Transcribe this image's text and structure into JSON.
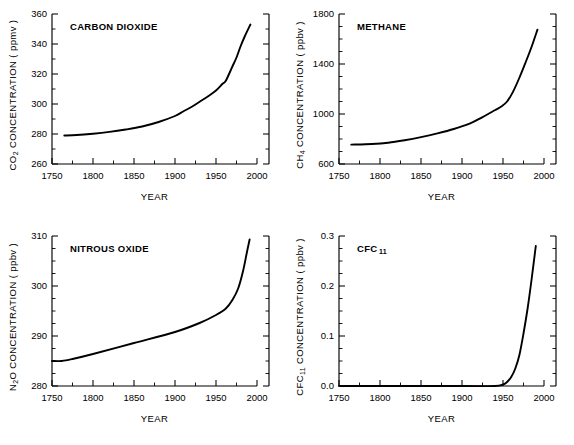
{
  "figure": {
    "background": "#ffffff",
    "line_color": "#000000",
    "panel_count": 4
  },
  "chart_data": [
    {
      "id": "carbon-dioxide",
      "type": "line",
      "title": "CARBON DIOXIDE",
      "ylabel_text": "CO2 CONCENTRATION ( ppmv )",
      "ylabel_species": "CO",
      "ylabel_species_sub": "2",
      "ylabel_rest": "CONCENTRATION ( ppmv )",
      "xlabel": "YEAR",
      "units": "ppmv",
      "xlim": [
        1750,
        2000
      ],
      "ylim": [
        260,
        360
      ],
      "xticks": [
        1750,
        1800,
        1850,
        1900,
        1950,
        2000
      ],
      "yticks": [
        260,
        280,
        300,
        320,
        340,
        360
      ],
      "xminor_step": 25,
      "yminor_step": 10,
      "grid": false,
      "legend": "none",
      "x": [
        1765,
        1780,
        1800,
        1820,
        1840,
        1860,
        1880,
        1900,
        1910,
        1920,
        1930,
        1940,
        1950,
        1958,
        1962,
        1970,
        1975,
        1980,
        1985,
        1992
      ],
      "values": [
        279.0,
        279.3,
        280.2,
        281.4,
        283.0,
        285.0,
        288.0,
        292.0,
        295.0,
        298.0,
        301.5,
        305.0,
        309.0,
        313.5,
        315.5,
        325.0,
        331.0,
        338.5,
        345.0,
        353.0
      ]
    },
    {
      "id": "methane",
      "type": "line",
      "title": "METHANE",
      "ylabel_species": "CH",
      "ylabel_species_sub": "4",
      "ylabel_rest": "CONCENTRATION ( ppbv )",
      "xlabel": "YEAR",
      "units": "ppbv",
      "xlim": [
        1750,
        2000
      ],
      "ylim": [
        600,
        1800
      ],
      "xticks": [
        1750,
        1800,
        1850,
        1900,
        1950,
        2000
      ],
      "yticks": [
        600,
        1000,
        1400,
        1800
      ],
      "xminor_step": 25,
      "yminor_step": 100,
      "grid": false,
      "legend": "none",
      "x": [
        1765,
        1790,
        1810,
        1830,
        1850,
        1870,
        1890,
        1910,
        1925,
        1940,
        1948,
        1955,
        1962,
        1970,
        1978,
        1985,
        1992
      ],
      "values": [
        755,
        760,
        770,
        790,
        815,
        845,
        880,
        925,
        975,
        1030,
        1060,
        1100,
        1175,
        1290,
        1420,
        1540,
        1675
      ]
    },
    {
      "id": "nitrous-oxide",
      "type": "line",
      "title": "NITROUS OXIDE",
      "ylabel_species": "N",
      "ylabel_species_sub": "2",
      "ylabel_species_tail": "O",
      "ylabel_rest": "CONCENTRATION ( ppbv )",
      "xlabel": "YEAR",
      "units": "ppbv",
      "xlim": [
        1750,
        2000
      ],
      "ylim": [
        280,
        310
      ],
      "xticks": [
        1750,
        1800,
        1850,
        1900,
        1950,
        2000
      ],
      "yticks": [
        280,
        290,
        300,
        310
      ],
      "xminor_step": 25,
      "yminor_step": 2.5,
      "grid": false,
      "legend": "none",
      "x": [
        1750,
        1762,
        1775,
        1800,
        1850,
        1900,
        1930,
        1950,
        1962,
        1970,
        1977,
        1983,
        1988,
        1991
      ],
      "values": [
        285.0,
        285.0,
        285.4,
        286.4,
        288.6,
        290.8,
        292.6,
        294.2,
        295.5,
        297.2,
        299.5,
        303.0,
        307.0,
        309.3
      ]
    },
    {
      "id": "cfc-11",
      "type": "line",
      "title_species": "CFC",
      "title_sub": "11",
      "title": "CFC 11",
      "ylabel_species": "CFC",
      "ylabel_species_sub": "11",
      "ylabel_rest": "CONCENTRATION ( ppbv )",
      "xlabel": "YEAR",
      "units": "ppbv",
      "xlim": [
        1750,
        2000
      ],
      "ylim": [
        0.0,
        0.3
      ],
      "xticks": [
        1750,
        1800,
        1850,
        1900,
        1950,
        2000
      ],
      "yticks": [
        "0.0",
        "0.1",
        "0.2",
        "0.3"
      ],
      "ytick_values": [
        0.0,
        0.1,
        0.2,
        0.3
      ],
      "xminor_step": 25,
      "yminor_step": 0.025,
      "grid": false,
      "legend": "none",
      "x": [
        1750,
        1900,
        1940,
        1950,
        1955,
        1960,
        1965,
        1970,
        1975,
        1980,
        1985,
        1990
      ],
      "values": [
        0.0,
        0.0,
        0.0,
        0.003,
        0.008,
        0.018,
        0.035,
        0.062,
        0.105,
        0.155,
        0.215,
        0.28
      ]
    }
  ]
}
